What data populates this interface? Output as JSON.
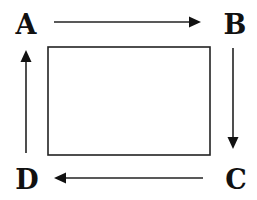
{
  "diagram": {
    "type": "cycle",
    "nodes": [
      {
        "id": "A",
        "label": "A",
        "position": "top-left"
      },
      {
        "id": "B",
        "label": "B",
        "position": "top-right"
      },
      {
        "id": "C",
        "label": "C",
        "position": "bottom-right"
      },
      {
        "id": "D",
        "label": "D",
        "position": "bottom-left"
      }
    ],
    "edges": [
      {
        "from": "A",
        "to": "B",
        "direction": "right"
      },
      {
        "from": "B",
        "to": "C",
        "direction": "down"
      },
      {
        "from": "C",
        "to": "D",
        "direction": "left"
      },
      {
        "from": "D",
        "to": "A",
        "direction": "up"
      }
    ],
    "center_box": {
      "label": ""
    },
    "colors": {
      "stroke": "#222222",
      "text": "#111111",
      "background": "#ffffff"
    }
  }
}
